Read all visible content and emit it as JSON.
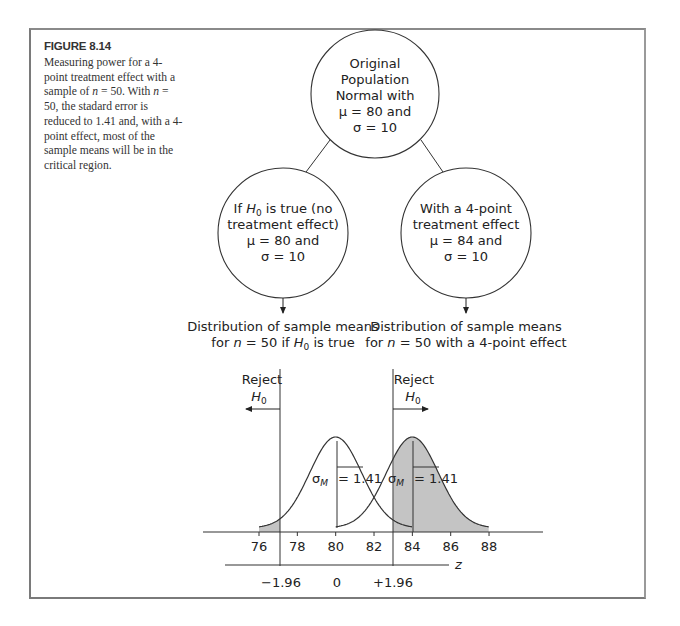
{
  "figure": {
    "label": "FIGURE 8.14",
    "caption_parts": [
      "Measuring power for a 4-point treatment effect with a sample of ",
      "n",
      " = 50. With ",
      "n",
      " = 50, the stadard error is reduced to 1.41 and, with a 4-point effect, most of the sample means will be in the critical region."
    ]
  },
  "diagram": {
    "top_node": {
      "lines": [
        "Original",
        "Population",
        "Normal with",
        "μ = 80 and",
        "σ = 10"
      ]
    },
    "left_node": {
      "line1_prefix": "If ",
      "line1_h": "H",
      "line1_sub": "0",
      "line1_suffix": " is true (no",
      "lines": [
        "treatment effect)",
        "μ = 80 and",
        "σ = 10"
      ]
    },
    "right_node": {
      "lines": [
        "With a 4-point",
        "treatment effect",
        "μ = 84 and",
        "σ = 10"
      ]
    },
    "left_dist_label": {
      "line1": "Distribution of sample means",
      "line2_prefix": "for ",
      "line2_n": "n",
      "line2_mid": " = 50 if ",
      "line2_h": "H",
      "line2_sub": "0",
      "line2_suffix": " is true"
    },
    "right_dist_label": {
      "line1": "Distribution of sample means",
      "line2_prefix": "for ",
      "line2_n": "n",
      "line2_suffix": " = 50 with a 4-point effect"
    },
    "reject_left": {
      "word": "Reject",
      "h": "H",
      "sub": "0"
    },
    "reject_right": {
      "word": "Reject",
      "h": "H",
      "sub": "0"
    }
  },
  "chart_data": {
    "type": "area",
    "xlabel": "X (sample mean)",
    "x_ticks": [
      76,
      78,
      80,
      82,
      84,
      86,
      88
    ],
    "xlim": [
      76,
      88
    ],
    "z_axis": {
      "label": "z",
      "ticks": [
        {
          "label": "−1.96",
          "x": 77.24
        },
        {
          "label": "0",
          "x": 80
        },
        {
          "label": "+1.96",
          "x": 82.76
        }
      ]
    },
    "series": [
      {
        "name": "H0 true",
        "mean": 80,
        "sd": 1.41,
        "sigma_label": "σ",
        "sigma_sub": "M",
        "sigma_value": "= 1.41",
        "shaded": "left tail x < 77.24"
      },
      {
        "name": "4-point effect",
        "mean": 84,
        "sd": 1.41,
        "sigma_label": "σ",
        "sigma_sub": "M",
        "sigma_value": "= 1.41",
        "shaded": "x > 82.76"
      }
    ],
    "critical_values": [
      77.24,
      82.76
    ],
    "colors": {
      "shade": "#c4c4c4",
      "line": "#333333"
    }
  }
}
